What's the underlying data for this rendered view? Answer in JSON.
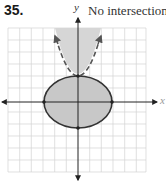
{
  "problem": {
    "number": "35.",
    "answer": "No intersection"
  },
  "axes": {
    "x_label": "x",
    "y_label": "y"
  },
  "graph": {
    "grid": {
      "x_min": -6,
      "x_max": 6,
      "y_min": -6,
      "y_max": 6
    },
    "ellipse": {
      "center": [
        0,
        0
      ],
      "rx": 3,
      "ry": 2.3,
      "style": "solid",
      "fill": "#c8c8c8",
      "stroke": "#333333"
    },
    "parabola": {
      "vertex": [
        0,
        2.3
      ],
      "opens": "up",
      "style": "dashed",
      "fill": "#d4d4d4",
      "stroke": "#555555"
    },
    "points": [
      [
        -3,
        0
      ],
      [
        3,
        0
      ],
      [
        0,
        -2.3
      ],
      [
        0,
        2.3
      ]
    ]
  },
  "colors": {
    "grid": "#d0d0d0",
    "axis": "#222222",
    "shade": "#c8c8c8"
  }
}
